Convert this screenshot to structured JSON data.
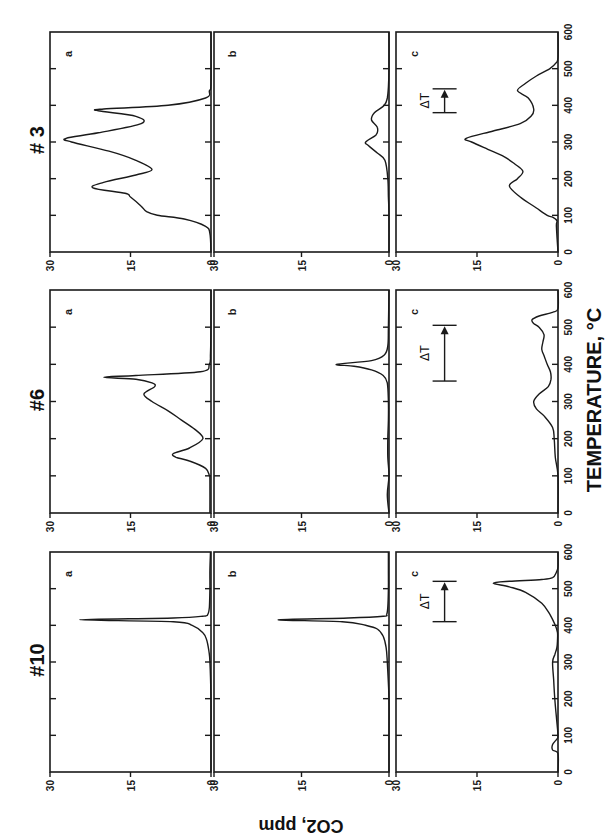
{
  "figure": {
    "xlabel": "TEMPERATURE, °C",
    "ylabel": "CO2, ppm",
    "samples": [
      "#10",
      "#6",
      "# 3"
    ],
    "panel_letters": [
      "a",
      "b",
      "c"
    ],
    "x_ticks": [
      0,
      100,
      200,
      300,
      400,
      500,
      600
    ],
    "y_ticks": [
      0,
      15,
      30
    ],
    "delta_t_label": "ΔT",
    "orientation": "rotated 90° counter-clockwise on page"
  },
  "chart_data": {
    "type": "line",
    "title": "",
    "xlabel": "TEMPERATURE, °C",
    "ylabel": "CO2, ppm",
    "xlim": [
      0,
      600
    ],
    "ylim": [
      0,
      30
    ],
    "grid": false,
    "layout": "3 samples (#10, #6, #3) × 3 panels (a, b, c)",
    "panels": [
      {
        "sample": "#10",
        "panel": "a",
        "x": [
          0,
          100,
          200,
          300,
          330,
          360,
          380,
          400,
          410,
          415,
          420,
          425,
          430,
          450,
          500,
          550,
          600
        ],
        "y": [
          0,
          0,
          0,
          0.2,
          0.4,
          0.8,
          1.5,
          3.5,
          7,
          24.5,
          7,
          1.5,
          0.6,
          0.3,
          0.2,
          0.2,
          0.1
        ]
      },
      {
        "sample": "#10",
        "panel": "b",
        "x": [
          0,
          100,
          200,
          300,
          340,
          370,
          390,
          400,
          410,
          415,
          420,
          425,
          430,
          450,
          500,
          550,
          600
        ],
        "y": [
          0,
          0,
          0,
          0.3,
          0.5,
          1,
          2,
          4,
          8,
          19,
          7,
          1,
          0.4,
          0.2,
          0.1,
          0.1,
          0.1
        ]
      },
      {
        "sample": "#10",
        "panel": "c",
        "x": [
          0,
          50,
          60,
          75,
          90,
          100,
          150,
          200,
          250,
          300,
          320,
          340,
          360,
          380,
          400,
          430,
          460,
          490,
          505,
          515,
          520,
          525,
          530,
          545,
          560,
          600
        ],
        "y": [
          0,
          0,
          1,
          1,
          0.2,
          0,
          0.3,
          0.6,
          0.8,
          1,
          0.6,
          0.2,
          0.1,
          0.1,
          0.5,
          1.5,
          3,
          6,
          9,
          12,
          9,
          3,
          1,
          0.3,
          0,
          0
        ],
        "delta_t": {
          "from": 410,
          "to": 520,
          "co2_level": 21
        }
      },
      {
        "sample": "#6",
        "panel": "a",
        "x": [
          0,
          90,
          100,
          120,
          140,
          150,
          160,
          175,
          200,
          225,
          250,
          275,
          300,
          320,
          340,
          350,
          360,
          365,
          370,
          380,
          400,
          430,
          500,
          600
        ],
        "y": [
          0.2,
          0.2,
          0.3,
          1,
          4,
          6.5,
          7,
          4,
          1.5,
          3,
          5.5,
          8,
          11,
          12.5,
          10.5,
          11,
          14,
          20,
          14,
          2,
          0.3,
          0.1,
          0,
          0
        ]
      },
      {
        "sample": "#6",
        "panel": "b",
        "x": [
          0,
          50,
          100,
          150,
          200,
          250,
          300,
          350,
          370,
          385,
          395,
          400,
          410,
          425,
          450,
          500,
          600
        ],
        "y": [
          0,
          0.3,
          0,
          0.2,
          0.2,
          0.1,
          0.1,
          0.3,
          1,
          3,
          6,
          9,
          3,
          0.8,
          0.2,
          0.1,
          0
        ],
        "note": "small wiggles 50–200 °C"
      },
      {
        "sample": "#6",
        "panel": "c",
        "x": [
          0,
          100,
          150,
          200,
          230,
          260,
          280,
          300,
          320,
          340,
          360,
          380,
          400,
          420,
          440,
          460,
          480,
          500,
          510,
          520,
          530,
          540,
          550,
          600
        ],
        "y": [
          0,
          0,
          0.5,
          0.7,
          1,
          2.5,
          4,
          4.5,
          3.5,
          1.8,
          1.3,
          1.4,
          2,
          2.5,
          3,
          2.8,
          2.6,
          3.5,
          4.5,
          4.8,
          3.5,
          1,
          0,
          0
        ],
        "delta_t": {
          "from": 355,
          "to": 505,
          "co2_level": 21
        }
      },
      {
        "sample": "#3",
        "panel": "a",
        "x": [
          0,
          50,
          70,
          90,
          100,
          110,
          125,
          150,
          160,
          175,
          190,
          210,
          225,
          250,
          275,
          300,
          310,
          325,
          350,
          370,
          385,
          390,
          400,
          420,
          440,
          460,
          600
        ],
        "y": [
          0,
          0.2,
          1,
          5,
          10,
          12,
          13,
          15,
          16,
          22,
          20,
          14,
          11,
          14,
          19,
          26,
          27,
          21,
          13,
          14,
          21,
          20,
          8,
          1,
          0.3,
          0,
          0
        ]
      },
      {
        "sample": "#3",
        "panel": "b",
        "x": [
          0,
          100,
          150,
          200,
          250,
          270,
          290,
          300,
          320,
          340,
          360,
          380,
          400,
          420,
          450,
          500,
          600
        ],
        "y": [
          0,
          0,
          0.1,
          0.2,
          0.7,
          2,
          3.5,
          4,
          2.2,
          2,
          3,
          2.5,
          0.8,
          0.3,
          0.1,
          0,
          0
        ]
      },
      {
        "sample": "#3",
        "panel": "c",
        "x": [
          0,
          70,
          85,
          95,
          100,
          120,
          150,
          180,
          200,
          220,
          240,
          260,
          280,
          300,
          310,
          330,
          350,
          370,
          390,
          420,
          440,
          460,
          480,
          500,
          515,
          530,
          600
        ],
        "y": [
          0,
          0.3,
          0.2,
          1,
          2,
          4,
          7,
          9,
          7.5,
          6.5,
          8,
          10,
          13,
          16,
          17,
          12,
          7,
          5,
          4.5,
          5.5,
          7.5,
          6,
          4,
          1.5,
          0.4,
          0,
          0
        ],
        "delta_t": {
          "from": 380,
          "to": 445,
          "co2_level": 21
        }
      }
    ]
  }
}
